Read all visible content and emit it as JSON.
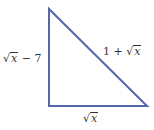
{
  "diagram": {
    "type": "right-triangle",
    "stroke_color": "#5566aa",
    "vertices": {
      "top": [
        49,
        9
      ],
      "bottom_left": [
        49,
        106
      ],
      "bottom_right": [
        147,
        106
      ]
    },
    "labels": {
      "left_side": {
        "root": "√",
        "radicand": "x",
        "suffix": " − 7"
      },
      "hypotenuse": {
        "prefix": "1 + ",
        "root": "√",
        "radicand": "x"
      },
      "bottom_side": {
        "root": "√",
        "radicand": "x"
      }
    }
  }
}
